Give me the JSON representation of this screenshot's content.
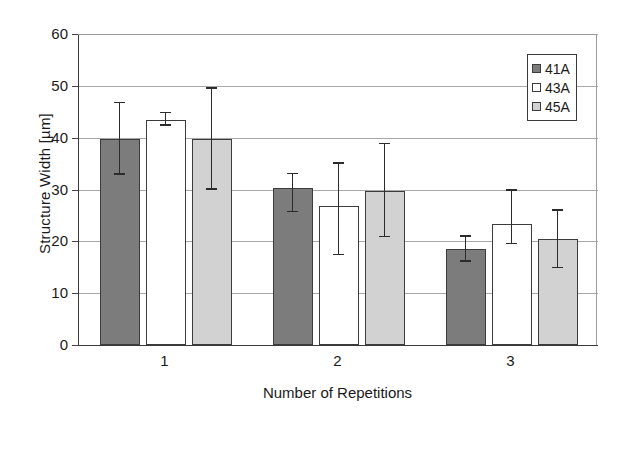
{
  "chart_data": {
    "type": "bar",
    "title": "",
    "xlabel": "Number of Repetitions",
    "ylabel": "Structure Width [µm]",
    "categories": [
      "1",
      "2",
      "3"
    ],
    "ylim": [
      0,
      60
    ],
    "yticks": [
      0,
      10,
      20,
      30,
      40,
      50,
      60
    ],
    "grid": true,
    "legend_position": "top-right",
    "series": [
      {
        "name": "41A",
        "color": "#7c7c7c",
        "values": [
          39.7,
          30.3,
          18.5
        ],
        "errors_upper": [
          6.9,
          2.6,
          2.4
        ],
        "errors_lower": [
          6.9,
          4.7,
          2.4
        ]
      },
      {
        "name": "43A",
        "color": "#ffffff",
        "values": [
          43.5,
          26.8,
          23.3
        ],
        "errors_upper": [
          1.2,
          8.2,
          6.5
        ],
        "errors_lower": [
          1.2,
          9.5,
          3.9
        ]
      },
      {
        "name": "45A",
        "color": "#d2d2d2",
        "values": [
          39.7,
          29.7,
          20.5
        ],
        "errors_upper": [
          9.7,
          9.0,
          5.4
        ],
        "errors_lower": [
          9.7,
          8.9,
          5.7
        ]
      }
    ]
  },
  "axes": {
    "ytick_labels": [
      "60",
      "50",
      "40",
      "30",
      "20",
      "10",
      "0"
    ],
    "xtick_labels": [
      "1",
      "2",
      "3"
    ],
    "y_axis_title": "Structure Width [µm]",
    "x_axis_title": "Number of Repetitions"
  },
  "legend": {
    "entries": [
      {
        "label": "41A",
        "color": "#7c7c7c"
      },
      {
        "label": "43A",
        "color": "#ffffff"
      },
      {
        "label": "45A",
        "color": "#d2d2d2"
      }
    ]
  }
}
